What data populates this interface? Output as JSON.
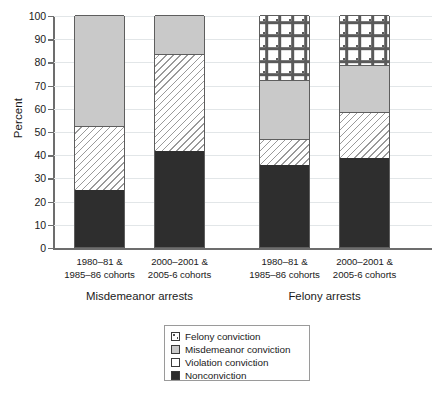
{
  "chart_data": {
    "type": "bar",
    "stacked": true,
    "title": "",
    "xlabel": "",
    "ylabel": "Percent",
    "ylim": [
      0,
      100
    ],
    "ytick_step": 10,
    "yticks": [
      0,
      10,
      20,
      30,
      40,
      50,
      60,
      70,
      80,
      90,
      100
    ],
    "grid": true,
    "legend_position": "bottom-center",
    "categories": [
      "1980–81 &\n1985–86 cohorts",
      "2000–2001 &\n2005-6 cohorts",
      "1980–81 &\n1985–86 cohorts",
      "2000–2001 &\n2005-6 cohorts"
    ],
    "groups": [
      {
        "label": "Misdemeanor arrests",
        "categories": [
          0,
          1
        ]
      },
      {
        "label": "Felony arrests",
        "categories": [
          2,
          3
        ]
      }
    ],
    "series": [
      {
        "name": "Nonconviction",
        "values": [
          24.5,
          41.5,
          35.5,
          38.5
        ]
      },
      {
        "name": "Violation conviction",
        "values": [
          27.5,
          41.5,
          11.0,
          19.5
        ]
      },
      {
        "name": "Misdemeanor conviction",
        "values": [
          48.0,
          17.0,
          25.5,
          20.5
        ]
      },
      {
        "name": "Felony conviction",
        "values": [
          0,
          0,
          28.0,
          21.5
        ]
      }
    ]
  },
  "axis": {
    "y_title": "Percent",
    "tick_labels": [
      "100",
      "90",
      "80",
      "70",
      "60",
      "50",
      "40",
      "30",
      "20",
      "10",
      "0"
    ]
  },
  "cohort_labels": [
    {
      "line1": "1980–81 &",
      "line2": "1985–86 cohorts"
    },
    {
      "line1": "2000–2001 &",
      "line2": "2005-6 cohorts"
    },
    {
      "line1": "1980–81 &",
      "line2": "1985–86 cohorts"
    },
    {
      "line1": "2000–2001 &",
      "line2": "2005-6 cohorts"
    }
  ],
  "group_labels": [
    {
      "label": "Misdemeanor arrests"
    },
    {
      "label": "Felony arrests"
    }
  ],
  "legend": {
    "items": [
      {
        "label": "Felony conviction",
        "swatch": "dotted-plus-pattern",
        "color": "#ffffff"
      },
      {
        "label": "Misdemeanor conviction",
        "swatch": "solid-gray",
        "color": "#c9c9c9"
      },
      {
        "label": "Violation conviction",
        "swatch": "diagonal-hatch",
        "color": "#ffffff"
      },
      {
        "label": "Nonconviction",
        "swatch": "solid-dark",
        "color": "#2e2e2e"
      }
    ]
  },
  "colors": {
    "nonconviction": "#2e2e2e",
    "misdemeanor_conviction": "#c9c9c9",
    "violation_conviction": "#ffffff",
    "felony_conviction": "#ffffff",
    "gridline": "#e2e6e8",
    "axis": "#6d6d6d"
  }
}
